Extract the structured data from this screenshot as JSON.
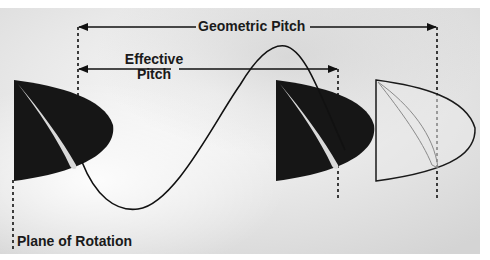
{
  "diagram": {
    "labels": {
      "geometric_pitch": "Geometric Pitch",
      "effective_pitch_line1": "Effective",
      "effective_pitch_line2": "Pitch",
      "plane_of_rotation": "Plane of Rotation"
    },
    "colors": {
      "background_light": "#f2f2f2",
      "background_mid": "#dcdcdc",
      "blade_fill": "#161616",
      "blade_highlight": "#d9d9d9",
      "outline": "#1a1a1a",
      "outline_blade_fill": "#e6e6e6",
      "outline_blade_inner": "#8a8a8a"
    },
    "elements": [
      {
        "id": "blade-1",
        "type": "solid-blade",
        "position": "plane of rotation"
      },
      {
        "id": "blade-2",
        "type": "solid-blade",
        "position": "effective pitch"
      },
      {
        "id": "blade-3",
        "type": "outline-blade",
        "position": "geometric pitch"
      },
      {
        "id": "helix-path",
        "type": "sine-curve"
      }
    ]
  }
}
